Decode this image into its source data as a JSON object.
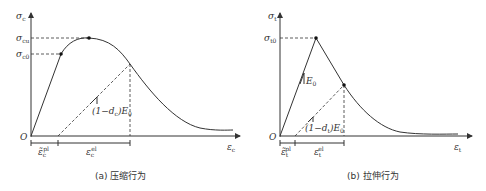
{
  "figure": {
    "panel_a": {
      "caption": "(a) 压缩行为",
      "y_axis_label": "σ",
      "y_axis_sub": "c",
      "x_axis_label": "ε",
      "x_axis_sub": "c",
      "origin_label": "O",
      "tick_cu": "σ",
      "tick_cu_sub": "cu",
      "tick_c0": "σ",
      "tick_c0_sub": "c0",
      "slope_label": "(1−d",
      "slope_sub": "c",
      "slope_tail": ")E",
      "slope_tail_sub": "0",
      "strain_pl": "ε̃",
      "strain_pl_sub": "c",
      "strain_pl_sup": "pl",
      "strain_el": "ε",
      "strain_el_sub": "c",
      "strain_el_sup": "el"
    },
    "panel_b": {
      "caption": "(b) 拉伸行为",
      "y_axis_label": "σ",
      "y_axis_sub": "t",
      "x_axis_label": "ε",
      "x_axis_sub": "t",
      "origin_label": "O",
      "tick_t0": "σ",
      "tick_t0_sub": "t0",
      "e0_label": "E",
      "e0_sub": "0",
      "slope_label": "(1−d",
      "slope_sub": "t",
      "slope_tail": ")E",
      "slope_tail_sub": "0",
      "strain_pl": "ε̃",
      "strain_pl_sub": "t",
      "strain_pl_sup": "pl",
      "strain_el": "ε",
      "strain_el_sub": "t",
      "strain_el_sup": "el"
    }
  }
}
